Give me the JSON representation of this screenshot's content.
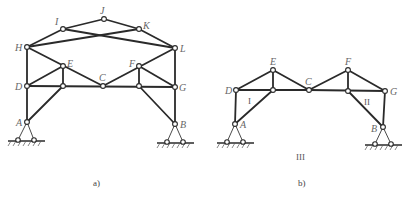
{
  "diagram": {
    "figures": [
      {
        "id": "a",
        "caption": "a)",
        "nodes": [
          {
            "name": "H",
            "x": 27,
            "y": 47
          },
          {
            "name": "I",
            "x": 63,
            "y": 29
          },
          {
            "name": "J",
            "x": 104,
            "y": 19
          },
          {
            "name": "K",
            "x": 139,
            "y": 29
          },
          {
            "name": "L",
            "x": 175,
            "y": 48
          },
          {
            "name": "E",
            "x": 63,
            "y": 66
          },
          {
            "name": "F",
            "x": 139,
            "y": 66
          },
          {
            "name": "D",
            "x": 27,
            "y": 86
          },
          {
            "name": "C",
            "x": 103,
            "y": 86
          },
          {
            "name": "G",
            "x": 175,
            "y": 87
          },
          {
            "name": "A",
            "x": 27,
            "y": 122
          },
          {
            "name": "B",
            "x": 175,
            "y": 124
          }
        ],
        "supports": [
          "A",
          "B"
        ]
      },
      {
        "id": "b",
        "caption": "b)",
        "nodes": [
          {
            "name": "D",
            "x": 236,
            "y": 90
          },
          {
            "name": "E",
            "x": 273,
            "y": 70
          },
          {
            "name": "C",
            "x": 309,
            "y": 90
          },
          {
            "name": "F",
            "x": 348,
            "y": 70
          },
          {
            "name": "G",
            "x": 385,
            "y": 91
          },
          {
            "name": "A",
            "x": 235,
            "y": 124
          },
          {
            "name": "B",
            "x": 383,
            "y": 127
          }
        ],
        "body_labels": [
          "I",
          "II",
          "III"
        ],
        "supports": [
          "A",
          "B"
        ]
      }
    ]
  },
  "labels": {
    "a": {
      "H": "H",
      "I": "I",
      "J": "J",
      "K": "K",
      "L": "L",
      "E": "E",
      "F": "F",
      "D": "D",
      "C": "C",
      "G": "G",
      "A": "A",
      "B": "B",
      "caption": "a)"
    },
    "b": {
      "D": "D",
      "E": "E",
      "C": "C",
      "F": "F",
      "G": "G",
      "A": "A",
      "B": "B",
      "body1": "I",
      "body2": "II",
      "body3": "III",
      "caption": "b)"
    }
  }
}
